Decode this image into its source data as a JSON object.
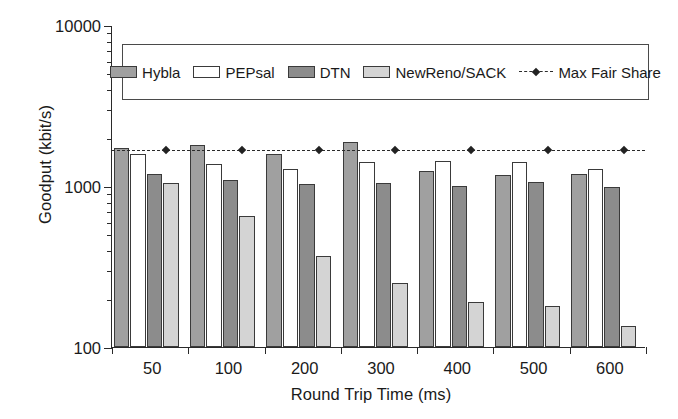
{
  "chart_data": {
    "type": "bar",
    "title": "",
    "xlabel": "Round Trip Time (ms)",
    "ylabel": "Goodput (kbit/s)",
    "categories": [
      "50",
      "100",
      "200",
      "300",
      "400",
      "500",
      "600"
    ],
    "yscale": "log",
    "ylim": [
      100,
      10000
    ],
    "ytick_labels": [
      "100",
      "1000",
      "10000"
    ],
    "ytick_values": [
      100,
      1000,
      10000
    ],
    "grid": false,
    "legend_position": "upper-center-inside",
    "series": [
      {
        "name": "Hybla",
        "color": "#a0a0a0",
        "values": [
          1730,
          1800,
          1580,
          1870,
          1240,
          1170,
          1180
        ]
      },
      {
        "name": "PEPsal",
        "color": "#ffffff",
        "values": [
          1570,
          1370,
          1270,
          1400,
          1420,
          1410,
          1270
        ]
      },
      {
        "name": "DTN",
        "color": "#8c8c8c",
        "values": [
          1190,
          1090,
          1030,
          1050,
          1000,
          1060,
          990
        ]
      },
      {
        "name": "NewReno/SACK",
        "color": "#d4d4d4",
        "values": [
          1050,
          650,
          370,
          250,
          190,
          180,
          135
        ]
      }
    ],
    "reference_line": {
      "name": "Max Fair Share",
      "value": 1700,
      "style": "dashed",
      "marker": "diamond",
      "color": "#2b2b2b"
    }
  },
  "legend": {
    "items": [
      {
        "label": "Hybla",
        "swatch": "s0",
        "kind": "box"
      },
      {
        "label": "PEPsal",
        "swatch": "s1",
        "kind": "box"
      },
      {
        "label": "DTN",
        "swatch": "s2",
        "kind": "box"
      },
      {
        "label": "NewReno/SACK",
        "swatch": "s3",
        "kind": "box"
      },
      {
        "label": "Max Fair Share",
        "swatch": "line",
        "kind": "line"
      }
    ]
  }
}
